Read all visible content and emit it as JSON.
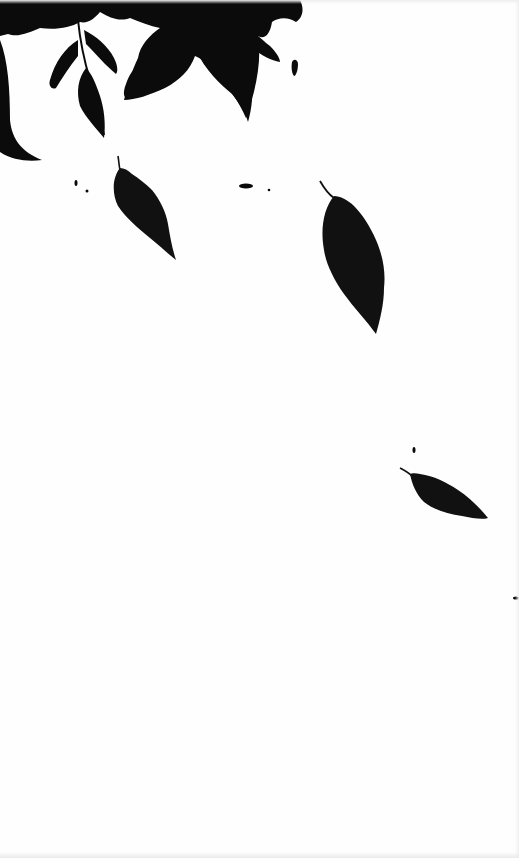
{
  "scene": {
    "description": "Black leaf silhouettes falling on white background",
    "background_color": "#fefefe",
    "ink_color": "#0a0a0a",
    "leaf_color": "#111111",
    "width": 519,
    "height": 858
  },
  "elements": {
    "canopy": "hanging-foliage-top-left",
    "falling_leaves": [
      {
        "name": "falling-leaf-1",
        "cx": 143,
        "cy": 208,
        "length": 105,
        "angle": -30
      },
      {
        "name": "falling-leaf-2",
        "cx": 352,
        "cy": 258,
        "length": 150,
        "angle": -18
      },
      {
        "name": "falling-leaf-3",
        "cx": 443,
        "cy": 492,
        "length": 90,
        "angle": -62
      }
    ],
    "specks": [
      {
        "x": 76,
        "y": 183
      },
      {
        "x": 87,
        "y": 191
      },
      {
        "x": 245,
        "y": 186
      },
      {
        "x": 269,
        "y": 190
      },
      {
        "x": 294,
        "y": 68
      },
      {
        "x": 414,
        "y": 450
      },
      {
        "x": 515,
        "y": 598
      }
    ]
  }
}
